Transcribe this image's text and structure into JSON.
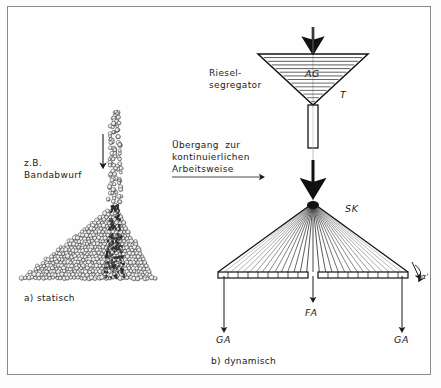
{
  "figure": {
    "title_alt": "Segregation bei statischer und dynamischer Schuettung",
    "background_color": "#fdfdfd",
    "frame_color": "#8a8a8a",
    "ink_color": "#1b1b1b"
  },
  "labels": {
    "left_source_line1": "z.B.",
    "left_source_line2": "Bandabwurf",
    "left_caption": "a) statisch",
    "transition_line1": "Übergang  zur",
    "transition_line2": "kontinuierlichen",
    "transition_line3": "Arbeitsweise",
    "funnel_name_line1": "Riesel-",
    "funnel_name_line2": "segregator",
    "funnel_inner": "AG",
    "funnel_edge": "T",
    "fan_label": "SK",
    "force_left": "GA",
    "force_center": "FA",
    "force_right": "GA",
    "angle": "α'",
    "right_caption": "b) dynamisch"
  },
  "diagram_a": {
    "kind": "granular-heap",
    "stream_top_y": 112,
    "stream_bottom_y": 205,
    "stream_x": 115,
    "heap_apex": [
      115,
      205
    ],
    "heap_left": [
      22,
      278
    ],
    "heap_right": [
      155,
      278
    ],
    "particle_count": 760,
    "particle_radius": 2.0,
    "arrow_x": 103,
    "arrow_y1": 134,
    "arrow_y2": 168
  },
  "diagram_b": {
    "kind": "funnel-and-fan",
    "feed_arrow_x": 313,
    "feed_arrow_y1": 28,
    "feed_arrow_y2": 48,
    "funnel_left": [
      258,
      54
    ],
    "funnel_right": [
      368,
      54
    ],
    "funnel_apex": [
      313,
      105
    ],
    "hatch_lines": 13,
    "stem_x": 313,
    "stem_half_width": 5,
    "stem_top": 105,
    "stem_bottom": 148,
    "drop_arrow_x": 313,
    "drop_arrow_y1": 158,
    "drop_arrow_y2": 190,
    "fan_apex": [
      313,
      203
    ],
    "fan_left_end": [
      218,
      272
    ],
    "fan_right_end": [
      408,
      272
    ],
    "fan_ray_count": 31,
    "plate_y": 272,
    "plate_height": 6,
    "plate_left": 218,
    "plate_right": 408,
    "plate_gap_center": 313,
    "plate_gap_width": 10,
    "plate_ticks_per_side": 9,
    "force_arrows": [
      {
        "name": "GA",
        "x": 224,
        "y1": 276,
        "y2": 332
      },
      {
        "name": "FA",
        "x": 313,
        "y1": 276,
        "y2": 300
      },
      {
        "name": "GA",
        "x": 402,
        "y1": 276,
        "y2": 332
      }
    ]
  }
}
